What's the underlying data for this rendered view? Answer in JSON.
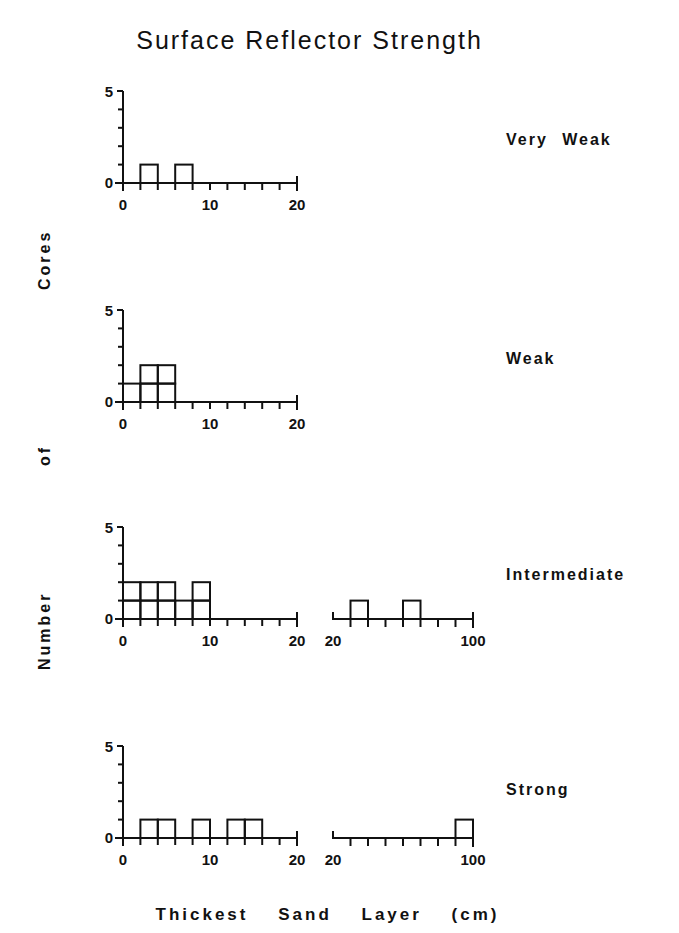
{
  "chart_data": {
    "type": "bar",
    "title": "Surface Reflector Strength",
    "xlabel": "Thickest Sand Layer (cm)",
    "ylabel": "Number of Cores",
    "grid": false,
    "legend": null,
    "ylim": [
      0,
      5
    ],
    "yticks": [
      0,
      5
    ],
    "axes": {
      "fine": {
        "range": [
          0,
          20
        ],
        "bin_width": 2,
        "tick_labels": [
          "0",
          "10",
          "20"
        ]
      },
      "coarse": {
        "range": [
          20,
          100
        ],
        "bin_width": 10,
        "tick_labels": [
          "20",
          "100"
        ]
      }
    },
    "panels": [
      {
        "label": "Very Weak",
        "fine_bins": [
          {
            "from": 2,
            "to": 4,
            "count": 1
          },
          {
            "from": 6,
            "to": 8,
            "count": 1
          }
        ],
        "coarse_bins": null
      },
      {
        "label": "Weak",
        "fine_bins": [
          {
            "from": 0,
            "to": 2,
            "count": 1
          },
          {
            "from": 2,
            "to": 4,
            "count": 2
          },
          {
            "from": 4,
            "to": 6,
            "count": 2
          }
        ],
        "coarse_bins": null
      },
      {
        "label": "Intermediate",
        "fine_bins": [
          {
            "from": 0,
            "to": 2,
            "count": 2
          },
          {
            "from": 2,
            "to": 4,
            "count": 2
          },
          {
            "from": 4,
            "to": 6,
            "count": 2
          },
          {
            "from": 6,
            "to": 8,
            "count": 1
          },
          {
            "from": 8,
            "to": 10,
            "count": 2
          }
        ],
        "coarse_bins": [
          {
            "from": 30,
            "to": 40,
            "count": 1
          },
          {
            "from": 60,
            "to": 70,
            "count": 1
          }
        ]
      },
      {
        "label": "Strong",
        "fine_bins": [
          {
            "from": 2,
            "to": 4,
            "count": 1
          },
          {
            "from": 4,
            "to": 6,
            "count": 1
          },
          {
            "from": 8,
            "to": 10,
            "count": 1
          },
          {
            "from": 12,
            "to": 14,
            "count": 1
          },
          {
            "from": 14,
            "to": 16,
            "count": 1
          }
        ],
        "coarse_bins": [
          {
            "from": 90,
            "to": 100,
            "count": 1
          }
        ]
      }
    ]
  },
  "text": {
    "title": "Surface Reflector Strength",
    "ylabel_parts": [
      "Number",
      "of",
      "Cores"
    ],
    "xlabel": "Thickest Sand Layer (cm)"
  }
}
